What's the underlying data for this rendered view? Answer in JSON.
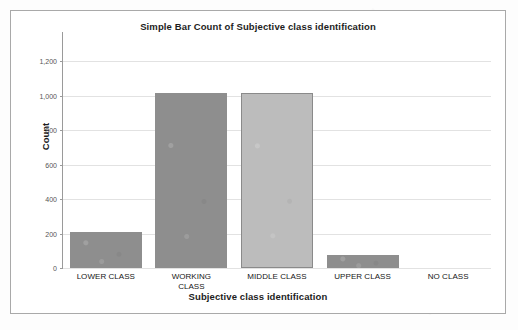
{
  "chart_data": {
    "type": "bar",
    "title": "Simple Bar Count of Subjective class identification",
    "xlabel": "Subjective class identification",
    "ylabel": "Count",
    "categories": [
      "LOWER CLASS",
      "WORKING CLASS",
      "MIDDLE CLASS",
      "UPPER CLASS",
      "NO CLASS"
    ],
    "values": [
      210,
      1015,
      1015,
      75,
      0
    ],
    "ylim": [
      0,
      1300
    ],
    "yticks": [
      0,
      200,
      400,
      600,
      800,
      1000,
      1200
    ],
    "ytick_labels": [
      "0",
      "200",
      "400",
      "600",
      "800",
      "1,000",
      "1,200"
    ],
    "grid": "horizontal",
    "legend": "none",
    "bar_colors": [
      "#8e8e8e",
      "#8e8e8e",
      "#bcbcbc",
      "#8e8e8e",
      "#8e8e8e"
    ],
    "colors": {
      "bar_dark": "#8e8e8e",
      "bar_light": "#bcbcbc",
      "bar_outline": "#8a8a8a",
      "gridline": "#e2e2e2",
      "axis": "#9a9a9a",
      "frame_border": "#a9a9a9",
      "plot_background": "#ffffff",
      "text": "#1d1d1d",
      "tick_text": "#555555"
    }
  }
}
